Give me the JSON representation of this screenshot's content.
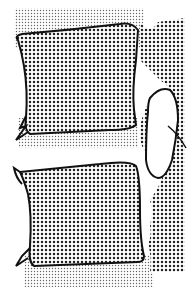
{
  "figure": {
    "colors": {
      "background": "#ffffff",
      "outline": "#111111",
      "bone_dots": "#222222",
      "disc_dots": "#555555",
      "foramen": "#ffffff"
    },
    "parts": [
      {
        "name": "upper-vertebral-body"
      },
      {
        "name": "lower-vertebral-body"
      },
      {
        "name": "intervertebral-disc"
      },
      {
        "name": "posterior-elements"
      },
      {
        "name": "intervertebral-foramen"
      },
      {
        "name": "anterior-osteophytes"
      }
    ]
  }
}
